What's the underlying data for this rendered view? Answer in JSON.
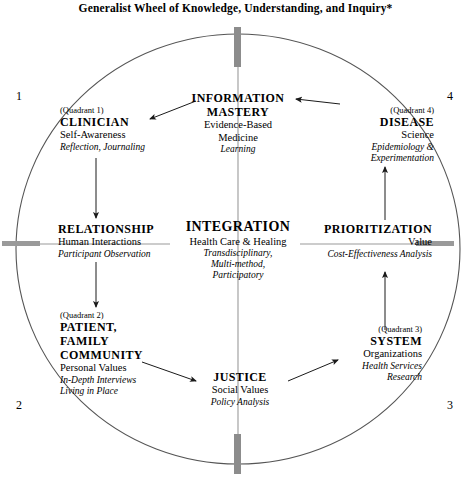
{
  "figure": {
    "title": "Generalist Wheel of Knowledge, Understanding, and Inquiry*",
    "colors": {
      "ink": "#000000",
      "circle_stroke": "#555555",
      "axis_marker": "#8c8c8c"
    }
  },
  "corner_numbers": {
    "top_left": "1",
    "top_right": "4",
    "bottom_left": "2",
    "bottom_right": "3"
  },
  "nodes": {
    "clinician": {
      "quadrant": "(Quadrant 1)",
      "heading": "CLINICIAN",
      "subject": "Self-Awareness",
      "method": "Reflection, Journaling"
    },
    "information_mastery": {
      "heading_line1": "INFORMATION",
      "heading_line2": "MASTERY",
      "subject_line1": "Evidence-Based",
      "subject_line2": "Medicine",
      "method": "Learning"
    },
    "disease": {
      "quadrant": "(Quadrant 4)",
      "heading": "DISEASE",
      "subject": "Science",
      "method_line1": "Epidemiology &",
      "method_line2": "Experimentation"
    },
    "relationship": {
      "heading": "RELATIONSHIP",
      "subject": "Human Interactions",
      "method": "Participant Observation"
    },
    "integration": {
      "heading": "INTEGRATION",
      "subject": "Health Care & Healing",
      "method_line1": "Transdisciplinary,",
      "method_line2": "Multi-method,",
      "method_line3": "Participatory"
    },
    "prioritization": {
      "heading": "PRIORITIZATION",
      "subject": "Value",
      "method": "Cost-Effectiveness Analysis"
    },
    "patient_family_community": {
      "quadrant": "(Quadrant 2)",
      "heading_line1": "PATIENT,",
      "heading_line2": "FAMILY",
      "heading_line3": "COMMUNITY",
      "subject": "Personal Values",
      "method_line1": "In-Depth Interviews",
      "method_line2": "Living in Place"
    },
    "justice": {
      "heading": "JUSTICE",
      "subject": "Social Values",
      "method": "Policy Analysis"
    },
    "system": {
      "quadrant": "(Quadrant 3)",
      "heading": "SYSTEM",
      "subject": "Organizations",
      "method_line1": "Health Services",
      "method_line2": "Research"
    }
  }
}
